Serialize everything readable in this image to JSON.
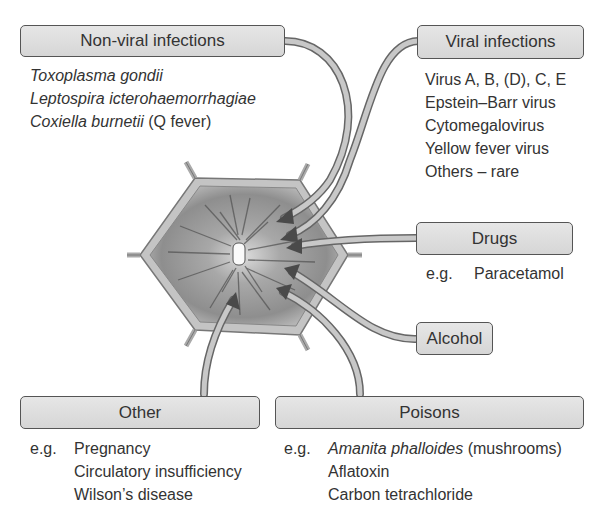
{
  "diagram": {
    "center": "Hepatocyte (liver cell) with radiating damage",
    "categories": {
      "non_viral": {
        "title": "Non-viral infections",
        "items": [
          "Toxoplasma gondii",
          "Leptospira icterohaemorrhagiae",
          "Coxiella burnetii",
          " (Q fever)"
        ]
      },
      "viral": {
        "title": "Viral infections",
        "items": [
          "Virus A, B, (D), C, E",
          "Epstein–Barr virus",
          "Cytomegalovirus",
          "Yellow fever virus",
          "Others – rare"
        ]
      },
      "drugs": {
        "title": "Drugs",
        "eg": "e.g.",
        "items": [
          "Paracetamol"
        ]
      },
      "alcohol": {
        "title": "Alcohol"
      },
      "other": {
        "title": "Other",
        "eg": "e.g.",
        "items": [
          "Pregnancy",
          "Circulatory insufficiency",
          "Wilson’s disease"
        ]
      },
      "poisons": {
        "title": "Poisons",
        "eg": "e.g.",
        "items": [
          "Amanita phalloides",
          " (mushrooms)",
          "Aflatoxin",
          "Carbon tetrachloride"
        ]
      }
    },
    "colors": {
      "box_fill": "#dcdcdc",
      "box_border": "#555555",
      "arrow_stroke": "#555555",
      "arrow_fill": "#c8c8c8",
      "cell_fill": "#9a9a9a"
    }
  }
}
